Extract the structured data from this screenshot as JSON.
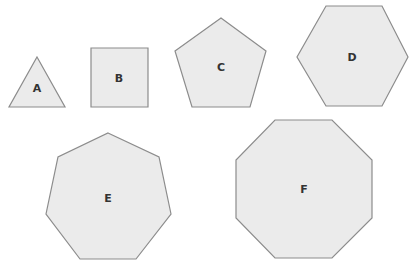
{
  "diagram": {
    "colors": {
      "fill": "#ebebeb",
      "stroke": "#8c8c8c",
      "label": "#333333",
      "background": "#ffffff"
    },
    "shapes": [
      {
        "id": "A",
        "label": "A",
        "type": "triangle",
        "sides": 3
      },
      {
        "id": "B",
        "label": "B",
        "type": "square",
        "sides": 4
      },
      {
        "id": "C",
        "label": "C",
        "type": "pentagon",
        "sides": 5
      },
      {
        "id": "D",
        "label": "D",
        "type": "hexagon",
        "sides": 6
      },
      {
        "id": "E",
        "label": "E",
        "type": "heptagon",
        "sides": 7
      },
      {
        "id": "F",
        "label": "F",
        "type": "octagon",
        "sides": 8
      }
    ]
  }
}
